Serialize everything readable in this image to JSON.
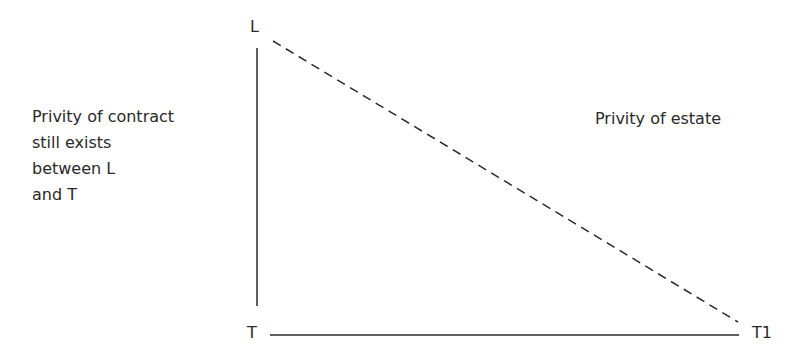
{
  "diagram": {
    "nodes": {
      "landlord": {
        "label": "L"
      },
      "tenant": {
        "label": "T"
      },
      "assignee": {
        "label": "T1"
      }
    },
    "edges": [
      {
        "from": "L",
        "to": "T",
        "style": "solid",
        "meaning": "Privity of contract"
      },
      {
        "from": "T",
        "to": "T1",
        "style": "solid"
      },
      {
        "from": "L",
        "to": "T1",
        "style": "dashed",
        "meaning": "Privity of estate"
      }
    ],
    "annotations": {
      "contract_note": [
        "Privity of contract",
        "still exists",
        "between L",
        "and T"
      ],
      "estate_note": "Privity of estate"
    },
    "colors": {
      "ink": "#2a2a2a",
      "background": "#ffffff"
    }
  }
}
